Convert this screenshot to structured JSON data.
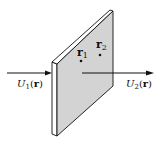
{
  "figure": {
    "type": "optical-element-diagram",
    "colors": {
      "plate_face": "#d3d3d3",
      "plate_edge": "#ffffff",
      "stroke": "#111111",
      "background": "#ffffff"
    },
    "input_field": {
      "symbol": "U",
      "subscript": "1",
      "argument": "r",
      "label": "U1(r)"
    },
    "output_field": {
      "symbol": "U",
      "subscript": "2",
      "argument": "r",
      "label": "U2(r)"
    },
    "points": [
      {
        "symbol": "r",
        "subscript": "1",
        "label": "r1"
      },
      {
        "symbol": "r",
        "subscript": "2",
        "label": "r2"
      }
    ]
  }
}
